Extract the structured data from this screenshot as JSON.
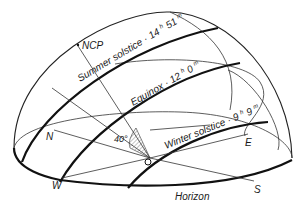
{
  "diagram": {
    "type": "celestial-sphere-sun-paths",
    "labels": {
      "ncp": "NCP",
      "summer": "Summer solstice",
      "summer_time_h": "14",
      "summer_time_m": "51",
      "equinox": "Equinox",
      "equinox_time_h": "12",
      "equinox_time_m": "0",
      "winter": "Winter solstice",
      "winter_time_h": "9",
      "winter_time_m": "9",
      "north": "N",
      "east": "E",
      "south": "S",
      "west": "W",
      "observer": "O",
      "horizon": "Horizon",
      "latitude_angle": "40°",
      "hour_unit": "h",
      "minute_unit": "m",
      "separator": "·"
    },
    "latitude_deg": 40,
    "day_lengths": [
      {
        "name": "Summer solstice",
        "hours": 14,
        "minutes": 51
      },
      {
        "name": "Equinox",
        "hours": 12,
        "minutes": 0
      },
      {
        "name": "Winter solstice",
        "hours": 9,
        "minutes": 9
      }
    ]
  }
}
